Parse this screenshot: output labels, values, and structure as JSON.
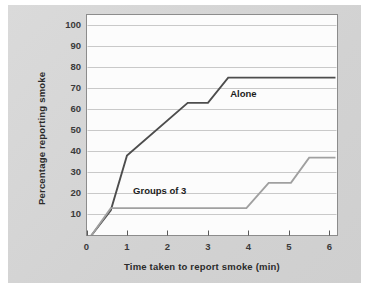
{
  "figure": {
    "background_color": "#ffffff",
    "card_color": "#d6d6d6",
    "plot_background_color": "#fcfcfc",
    "plot_border_color": "#8c8c8c",
    "gridline_color": "#c9c9c9"
  },
  "chart_data": {
    "type": "line",
    "title": "",
    "xlabel": "Time taken to report smoke (min)",
    "ylabel": "Percentage reporting smoke",
    "xlim": [
      0,
      6.2
    ],
    "ylim": [
      0,
      105
    ],
    "xticks": [
      0,
      1,
      2,
      3,
      4,
      5,
      6
    ],
    "xtick_labels": [
      "0",
      "1",
      "2",
      "3",
      "4",
      "5",
      "6"
    ],
    "yticks": [
      10,
      20,
      30,
      40,
      50,
      60,
      70,
      80,
      90,
      100
    ],
    "ytick_labels": [
      "10",
      "20",
      "30",
      "40",
      "50",
      "60",
      "70",
      "80",
      "90",
      "100"
    ],
    "grid": "horizontal",
    "legend": "inline-annotations",
    "series": [
      {
        "name": "Alone",
        "color": "#4d4d4d",
        "line_width": 1.9,
        "label_position": {
          "x": 3.55,
          "y": 67
        },
        "x": [
          0.12,
          0.6,
          1.0,
          2.5,
          3.0,
          3.5,
          6.15
        ],
        "y": [
          0,
          12,
          38,
          63,
          63,
          75,
          75
        ]
      },
      {
        "name": "Groups of 3",
        "color": "#a0a0a0",
        "line_width": 1.9,
        "label_position": {
          "x": 1.15,
          "y": 21
        },
        "x": [
          0.12,
          0.6,
          3.95,
          4.5,
          5.05,
          5.5,
          6.15
        ],
        "y": [
          0,
          13,
          13,
          25,
          25,
          37,
          37
        ]
      }
    ]
  }
}
